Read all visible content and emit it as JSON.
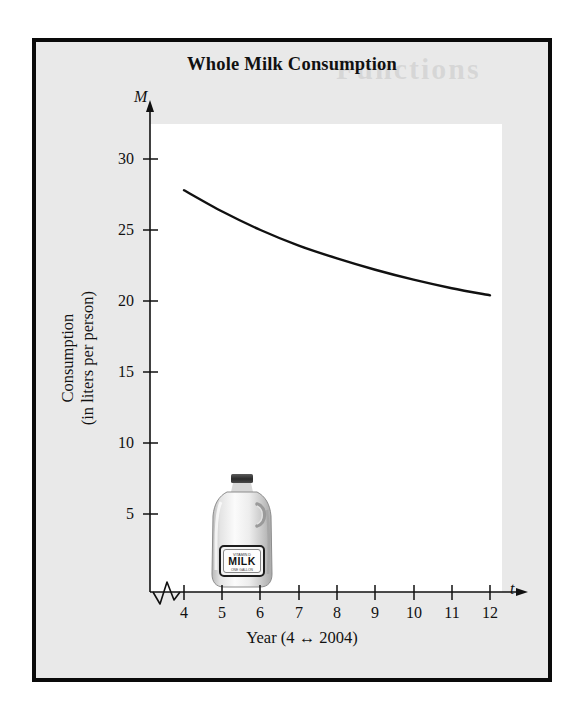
{
  "figure": {
    "title": "Whole Milk Consumption",
    "ghost_text_top": "Functions",
    "ghost_text_mid": "no or"
  },
  "illustration": {
    "name": "milk-jug",
    "label_text": "MILK",
    "label_top_text": "VITAMIN D",
    "label_bottom_text": "ONE GALLON"
  },
  "chart_data": {
    "type": "line",
    "title": "Whole Milk Consumption",
    "xlabel": "Year (4 ↔ 2004)",
    "ylabel_line1": "Consumption",
    "ylabel_line2": "(in liters per person)",
    "x_axis_variable": "t",
    "y_axis_variable": "M",
    "xlim": [
      3.55,
      12.6
    ],
    "ylim": [
      0,
      33
    ],
    "xticks": [
      4,
      5,
      6,
      7,
      8,
      9,
      10,
      11,
      12
    ],
    "xtick_labels": [
      "4",
      "5",
      "6",
      "7",
      "8",
      "9",
      "10",
      "11",
      "12"
    ],
    "yticks": [
      5,
      10,
      15,
      20,
      25,
      30
    ],
    "ytick_labels": [
      "5",
      "10",
      "15",
      "20",
      "25",
      "30"
    ],
    "grid": false,
    "legend": null,
    "axis_break": {
      "axis": "x",
      "shape": "zigzag",
      "between": [
        0,
        4
      ]
    },
    "series": [
      {
        "name": "Whole milk consumption",
        "color": "#111111",
        "x": [
          4,
          5,
          6,
          7,
          8,
          9,
          10,
          11,
          12
        ],
        "values": [
          27.8,
          26.3,
          25.0,
          23.9,
          23.0,
          22.2,
          21.5,
          20.9,
          20.4
        ]
      }
    ]
  }
}
